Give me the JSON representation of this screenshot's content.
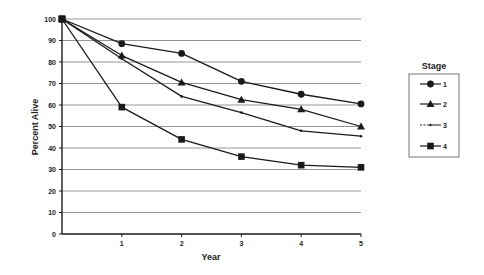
{
  "chart_data": {
    "type": "line",
    "title": "",
    "xlabel": "Year",
    "ylabel": "Percent Alive",
    "x": [
      0,
      1,
      2,
      3,
      4,
      5
    ],
    "x_tick_labels": [
      "",
      "1",
      "2",
      "3",
      "4",
      "5"
    ],
    "y_ticks": [
      0,
      10,
      20,
      30,
      40,
      50,
      60,
      70,
      80,
      90,
      100
    ],
    "xlim": [
      0,
      5
    ],
    "ylim": [
      0,
      100
    ],
    "grid": "horizontal",
    "legend": {
      "title": "Stage",
      "position": "right"
    },
    "series": [
      {
        "name": "1",
        "marker": "circle",
        "line": "solid",
        "values": [
          100,
          88.5,
          84,
          71,
          65,
          60.5
        ]
      },
      {
        "name": "2",
        "marker": "triangle",
        "line": "solid",
        "values": [
          100,
          83,
          70.5,
          62.5,
          58,
          50
        ]
      },
      {
        "name": "3",
        "marker": "dot",
        "line": "solid",
        "values": [
          100,
          81.5,
          64,
          56.5,
          48,
          45.5
        ]
      },
      {
        "name": "4",
        "marker": "square",
        "line": "solid",
        "values": [
          100,
          59,
          44,
          36,
          32,
          31
        ]
      }
    ]
  },
  "colors": {
    "line": "#1a1a1a",
    "grid": "#8a8a8a",
    "background": "#ffffff"
  }
}
